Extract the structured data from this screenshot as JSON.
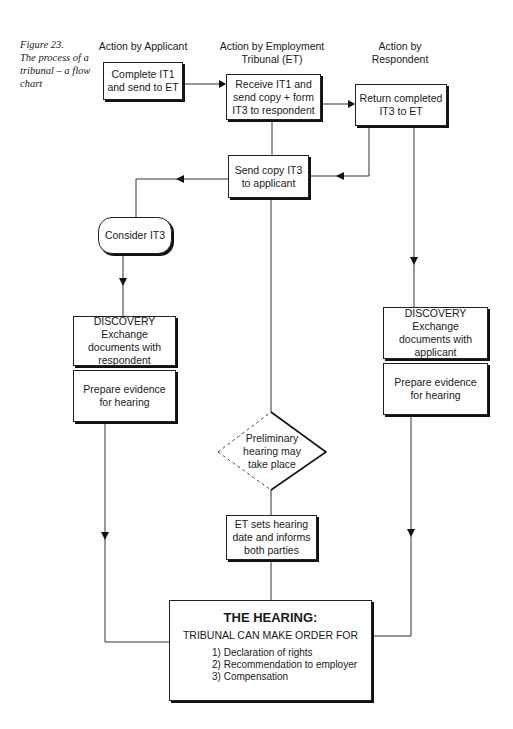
{
  "caption": {
    "figure": "Figure 23.",
    "text": "The process of a tribunal – a flow chart"
  },
  "columns": {
    "applicant": "Action by Applicant",
    "tribunal": "Action by Employment Tribunal (ET)",
    "respondent": "Action by Respondent"
  },
  "nodes": {
    "complete_it1": "Complete IT1 and send to ET",
    "receive_it1": "Receive IT1 and send copy + form IT3 to respondent",
    "return_it3": "Return completed IT3 to ET",
    "send_copy_it3": "Send copy IT3 to applicant",
    "consider_it3": "Consider IT3",
    "discovery_applicant_title": "DISCOVERY",
    "discovery_applicant_text": "Exchange documents with respondent",
    "prepare_applicant": "Prepare evidence for hearing",
    "discovery_respondent_title": "DISCOVERY",
    "discovery_respondent_text": "Exchange documents with applicant",
    "prepare_respondent": "Prepare evidence for hearing",
    "preliminary": "Preliminary hearing may take place",
    "et_sets_date": "ET sets hearing date and informs both parties"
  },
  "hearing": {
    "title": "THE HEARING:",
    "subtitle": "TRIBUNAL CAN MAKE ORDER FOR",
    "items": [
      "1) Declaration of rights",
      "2) Recommendation to employer",
      "3) Compensation"
    ]
  },
  "colors": {
    "line": "#333333",
    "border": "#222222",
    "shadow": "#111111"
  }
}
